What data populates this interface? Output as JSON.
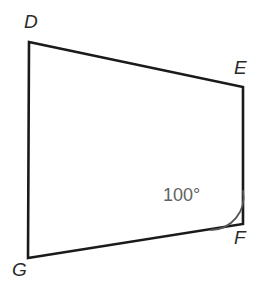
{
  "figure": {
    "type": "quadrilateral",
    "name": "quadrilateral-DEFG",
    "background_color": "#ffffff",
    "width": 260,
    "height": 282,
    "stroke_color": "#1a1a1a",
    "stroke_width": 2.6,
    "label_color": "#2b2b2b",
    "arc_color": "#555555",
    "angle_text_color": "#636363",
    "vertices": [
      {
        "id": "D",
        "label": "D",
        "x": 29,
        "y": 42,
        "label_x": 24,
        "label_y": 12
      },
      {
        "id": "E",
        "label": "E",
        "x": 243,
        "y": 87,
        "label_x": 234,
        "label_y": 58
      },
      {
        "id": "F",
        "label": "F",
        "x": 243,
        "y": 224,
        "label_x": 234,
        "label_y": 228
      },
      {
        "id": "G",
        "label": "G",
        "x": 28,
        "y": 258,
        "label_x": 12,
        "label_y": 260
      }
    ],
    "edges": [
      {
        "id": "DE",
        "from": "D",
        "to": "E"
      },
      {
        "id": "EF",
        "from": "E",
        "to": "F"
      },
      {
        "id": "FG",
        "from": "F",
        "to": "G"
      },
      {
        "id": "GD",
        "from": "G",
        "to": "D"
      }
    ],
    "angle_marks": [
      {
        "id": "angle-F",
        "at_vertex": "F",
        "value": "100°",
        "measure": 100,
        "unit": "degrees",
        "arc_radius": 33,
        "label_x": 163,
        "label_y": 186
      }
    ],
    "path": "M 29 42 L 243 87 L 243 224 L 28 258 Z",
    "arc_path": "M 243 191 A 33 33 0 0 1 211 230"
  }
}
